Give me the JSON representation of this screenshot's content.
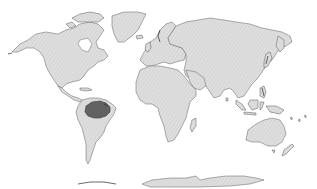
{
  "map": {
    "type": "world-distribution-map",
    "projection": "equirectangular-like",
    "background_color": "#ffffff",
    "land_color": "#dcdcdc",
    "land_hatch_color": "#c4c4c4",
    "coastline_color": "#6a6a6a",
    "highlight_color": "#5c5c5c",
    "highlighted_region": {
      "name": "Amazon basin (northern South America)",
      "continent": "South America"
    },
    "continents": [
      "North America",
      "Greenland",
      "South America",
      "Europe",
      "Africa",
      "Asia",
      "Australia",
      "Antarctica"
    ],
    "labels": []
  }
}
